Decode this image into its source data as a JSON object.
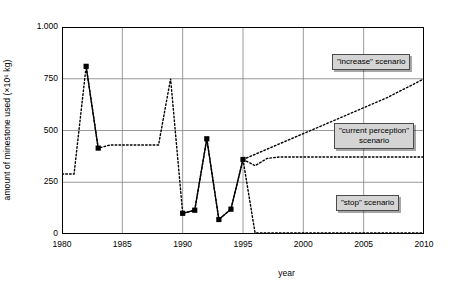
{
  "chart_data": {
    "type": "line",
    "title": "",
    "xlabel": "year",
    "ylabel": "amount of minestone used (×10⁶ kg)",
    "xlim": [
      1980,
      2010
    ],
    "ylim": [
      0,
      1000
    ],
    "xticks": [
      "1980",
      "1985",
      "1990",
      "1995",
      "2000",
      "2005",
      "2010"
    ],
    "yticks": [
      "0",
      "250",
      "500",
      "750",
      "1.000"
    ],
    "grid": true,
    "legend_position": "inside-right",
    "series": [
      {
        "name": "measured",
        "style": "solid-with-square-markers",
        "x": [
          1982,
          1983,
          1990,
          1991,
          1992,
          1993,
          1994,
          1995
        ],
        "values": [
          810,
          415,
          100,
          115,
          460,
          70,
          120,
          360
        ],
        "segments": [
          [
            1982,
            1983
          ],
          [
            1990,
            1991,
            1992,
            1993,
            1994,
            1995
          ]
        ]
      },
      {
        "name": "history-dotted",
        "style": "dotted",
        "x": [
          1980,
          1981,
          1982,
          1983,
          1984,
          1985,
          1986,
          1987,
          1988,
          1989,
          1990,
          1991,
          1992,
          1993,
          1994,
          1995
        ],
        "values": [
          290,
          290,
          810,
          415,
          430,
          430,
          430,
          430,
          430,
          750,
          100,
          115,
          460,
          70,
          120,
          360
        ]
      },
      {
        "name": "\"increase\" scenario",
        "style": "dotted",
        "x": [
          1995,
          1996,
          1997,
          1998,
          1999,
          2000,
          2001,
          2002,
          2003,
          2004,
          2005,
          2006,
          2007,
          2008,
          2009,
          2010
        ],
        "values": [
          360,
          385,
          410,
          435,
          460,
          485,
          510,
          535,
          560,
          585,
          610,
          635,
          660,
          690,
          720,
          750
        ]
      },
      {
        "name": "\"current perception\" scenario",
        "style": "dotted",
        "x": [
          1995,
          1996,
          1997,
          1998,
          2000,
          2002,
          2005,
          2008,
          2010
        ],
        "values": [
          360,
          330,
          365,
          372,
          372,
          372,
          372,
          372,
          372
        ]
      },
      {
        "name": "\"stop\" scenario",
        "style": "dotted",
        "x": [
          1995,
          1996,
          1997,
          2000,
          2005,
          2010
        ],
        "values": [
          360,
          5,
          5,
          5,
          5,
          5
        ]
      }
    ],
    "annotations": [
      {
        "text": "\"increase\" scenario",
        "lines": [
          "\"increase\" scenario"
        ]
      },
      {
        "text": "\"current perception\" scenario",
        "lines": [
          "\"current perception\"",
          "scenario"
        ]
      },
      {
        "text": "\"stop\" scenario",
        "lines": [
          "\"stop\" scenario"
        ]
      }
    ],
    "colors": {
      "line": "#000000",
      "grid": "#808080",
      "axis": "#000000",
      "label_box_fill": "#d4d4d4",
      "label_box_border": "#4a4a4a",
      "background": "#ffffff"
    }
  }
}
